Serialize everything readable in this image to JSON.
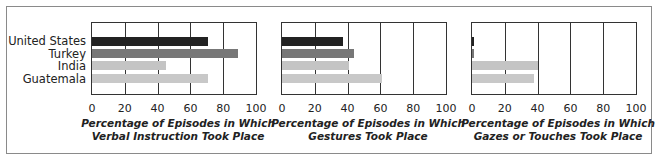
{
  "chart_data": [
    {
      "type": "bar",
      "orientation": "horizontal",
      "categories": [
        "United States",
        "Turkey",
        "India",
        "Guatemala"
      ],
      "values": [
        71,
        89,
        45,
        71
      ],
      "title": "Percentage of Episodes in Which Verbal Instruction Took Place",
      "title_lines": [
        "Percentage of Episodes in Which",
        "Verbal Instruction Took Place"
      ],
      "xlabel": "Percentage of Episodes in Which Verbal Instruction Took Place",
      "ylabel": "",
      "xlim": [
        0,
        100
      ],
      "xticks": [
        "0",
        "20",
        "40",
        "60",
        "80",
        "100"
      ],
      "grid": true,
      "bar_colors": [
        "#222222",
        "#777777",
        "#c4c4c4",
        "#c8c8c8"
      ]
    },
    {
      "type": "bar",
      "orientation": "horizontal",
      "categories": [
        "United States",
        "Turkey",
        "India",
        "Guatemala"
      ],
      "values": [
        37,
        44,
        41,
        61
      ],
      "title": "Percentage of Episodes in Which Gestures Took Place",
      "title_lines": [
        "Percentage of Episodes in Which",
        "Gestures Took Place"
      ],
      "xlabel": "Percentage of Episodes in Which Gestures Took Place",
      "ylabel": "",
      "xlim": [
        0,
        100
      ],
      "xticks": [
        "0",
        "20",
        "40",
        "60",
        "80",
        "100"
      ],
      "grid": true,
      "bar_colors": [
        "#222222",
        "#777777",
        "#c4c4c4",
        "#c8c8c8"
      ]
    },
    {
      "type": "bar",
      "orientation": "horizontal",
      "categories": [
        "United States",
        "Turkey",
        "India",
        "Guatemala"
      ],
      "values": [
        1,
        1,
        40,
        38
      ],
      "title": "Percentage of Episodes in Which Gazes or Touches Took Place",
      "title_lines": [
        "Percentage of Episodes in Which",
        "Gazes or Touches Took Place"
      ],
      "xlabel": "Percentage of Episodes in Which Gazes or Touches Took Place",
      "ylabel": "",
      "xlim": [
        0,
        100
      ],
      "xticks": [
        "0",
        "20",
        "40",
        "60",
        "80",
        "100"
      ],
      "grid": true,
      "bar_colors": [
        "#222222",
        "#777777",
        "#c4c4c4",
        "#c8c8c8"
      ]
    }
  ],
  "legend": {
    "labels": [
      "United States",
      "Turkey",
      "India",
      "Guatemala"
    ]
  }
}
